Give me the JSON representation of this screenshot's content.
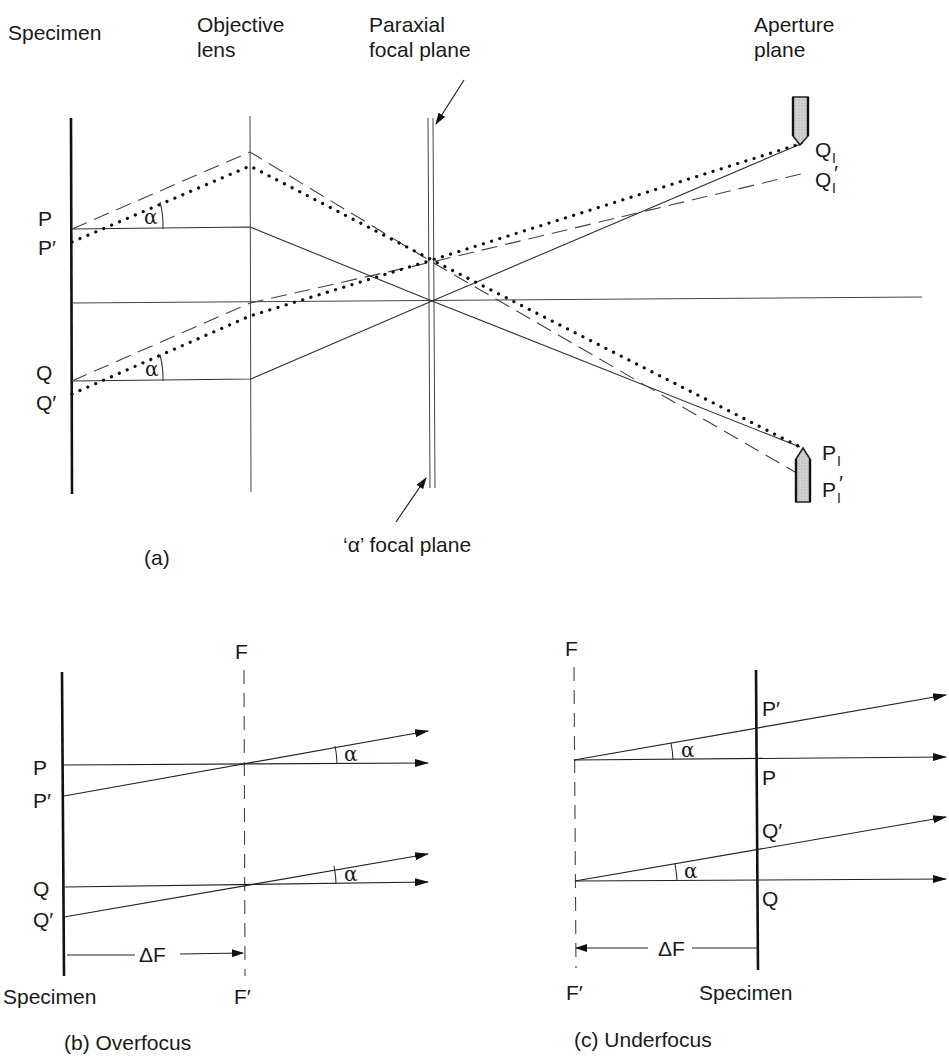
{
  "panel_a": {
    "caption": "(a)",
    "headers": {
      "specimen": "Specimen",
      "objective_line1": "Objective",
      "objective_line2": "lens",
      "paraxial_line1": "Paraxial",
      "paraxial_line2": "focal plane",
      "aperture_line1": "Aperture",
      "aperture_line2": "plane"
    },
    "alpha_focal_plane": "‘α’ focal plane",
    "points": {
      "P": "P",
      "P_prime": "P′",
      "Q": "Q",
      "Q_prime": "Q′",
      "Q_I": "Q",
      "Q_I_prime": "Q",
      "P_I": "P",
      "P_I_prime": "P",
      "sub_I": "I",
      "prime": "′"
    },
    "angle_symbol": "α"
  },
  "panel_b": {
    "caption": "(b) Overfocus",
    "F": "F",
    "F_prime": "F′",
    "P": "P",
    "P_prime": "P′",
    "Q": "Q",
    "Q_prime": "Q′",
    "delta_F": "ΔF",
    "specimen": "Specimen",
    "angle_symbol": "α"
  },
  "panel_c": {
    "caption": "(c) Underfocus",
    "F": "F",
    "F_prime": "F′",
    "P": "P",
    "P_prime": "P′",
    "Q": "Q",
    "Q_prime": "Q′",
    "delta_F": "ΔF",
    "specimen": "Specimen",
    "angle_symbol": "α"
  },
  "colors": {
    "ink": "#1a1a1a",
    "aperture_fill": "#c8c8c8",
    "background": "#ffffff"
  }
}
